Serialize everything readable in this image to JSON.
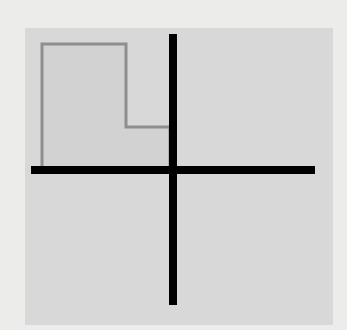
{
  "diagram": {
    "type": "coordinate-plane-shape",
    "background_color": "#ececea",
    "panel": {
      "x": 25,
      "y": 28,
      "width": 308,
      "height": 297,
      "color": "#d8d8d8"
    },
    "axes": {
      "color": "#000000",
      "thickness": 8,
      "horizontal": {
        "x1": 31,
        "x2": 315,
        "y": 170
      },
      "vertical": {
        "x": 173,
        "y1": 34,
        "y2": 305
      }
    },
    "shape": {
      "name": "L-shaped region",
      "quadrant": "upper-left",
      "stroke_color": "#8e8e8e",
      "fill_color": "#d2d2d2",
      "stroke_width": 3,
      "points": [
        [
          42,
          170
        ],
        [
          42,
          44
        ],
        [
          126,
          44
        ],
        [
          126,
          127
        ],
        [
          170,
          127
        ],
        [
          170,
          170
        ]
      ]
    }
  }
}
